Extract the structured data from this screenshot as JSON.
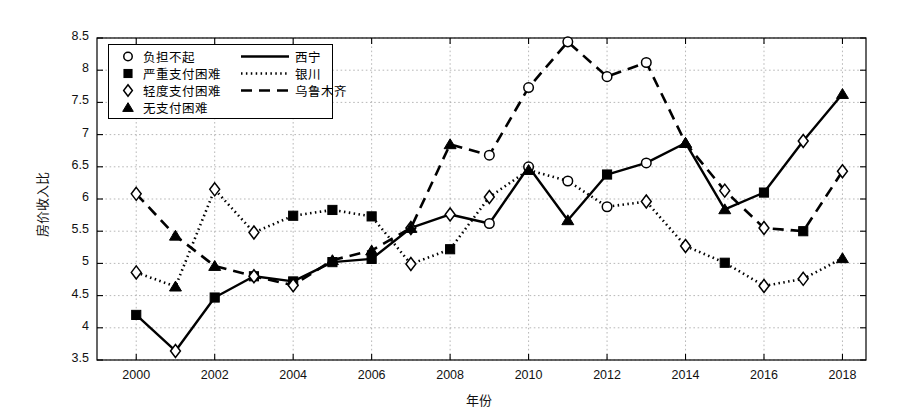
{
  "chart_data": {
    "type": "line",
    "title": "",
    "xlabel": "年份",
    "ylabel": "房价收入比",
    "xlim": [
      1999,
      2018.6
    ],
    "ylim": [
      3.5,
      8.5
    ],
    "grid": true,
    "legend_position": "top-left",
    "x": [
      2000,
      2001,
      2002,
      2003,
      2004,
      2005,
      2006,
      2007,
      2008,
      2009,
      2010,
      2011,
      2012,
      2013,
      2014,
      2015,
      2016,
      2017,
      2018
    ],
    "xticks": [
      2000,
      2002,
      2004,
      2006,
      2008,
      2010,
      2012,
      2014,
      2016,
      2018
    ],
    "xticklabels": [
      "2000",
      "2002",
      "2004",
      "2006",
      "2008",
      "2010",
      "2012",
      "2014",
      "2016",
      "2018"
    ],
    "yticks": [
      3.5,
      4,
      4.5,
      5,
      5.5,
      6,
      6.5,
      7,
      7.5,
      8,
      8.5
    ],
    "yticklabels": [
      "3.5",
      "4",
      "4.5",
      "5",
      "5.5",
      "6",
      "6.5",
      "7",
      "7.5",
      "8",
      "8.5"
    ],
    "series": [
      {
        "name": "西宁",
        "linestyle": "solid",
        "color": "#000000",
        "values": [
          4.2,
          3.64,
          4.47,
          4.8,
          4.72,
          5.02,
          5.07,
          5.55,
          5.76,
          5.62,
          6.5,
          5.67,
          6.38,
          6.56,
          6.87,
          5.84,
          6.1,
          6.9,
          7.63
        ]
      },
      {
        "name": "银川",
        "linestyle": "dotted",
        "color": "#000000",
        "values": [
          4.86,
          4.64,
          6.15,
          5.48,
          5.74,
          5.83,
          5.73,
          4.99,
          5.22,
          6.03,
          6.45,
          6.28,
          5.88,
          5.96,
          5.27,
          5.01,
          4.65,
          4.76,
          5.08
        ]
      },
      {
        "name": "乌鲁木齐",
        "linestyle": "dashed",
        "color": "#000000",
        "values": [
          6.08,
          5.43,
          4.96,
          4.8,
          4.66,
          5.05,
          5.2,
          5.55,
          6.85,
          6.68,
          7.73,
          8.44,
          7.9,
          8.12,
          6.87,
          6.13,
          5.55,
          5.5,
          6.43
        ]
      }
    ],
    "marker_legend": [
      {
        "marker": "circle-open",
        "label": "负担不起"
      },
      {
        "marker": "square-filled",
        "label": "严重支付困难"
      },
      {
        "marker": "diamond-open",
        "label": "轻度支付困难"
      },
      {
        "marker": "triangle-filled",
        "label": "无支付困难"
      }
    ],
    "marker_by_point": {
      "西宁": [
        "square-filled",
        "diamond-open",
        "square-filled",
        "square-filled",
        "square-filled",
        "square-filled",
        "square-filled",
        "diamond-open",
        "diamond-open",
        "circle-open",
        "circle-open",
        "triangle-filled",
        "square-filled",
        "circle-open",
        "triangle-filled",
        "triangle-filled",
        "square-filled",
        "diamond-open",
        "triangle-filled"
      ],
      "银川": [
        "diamond-open",
        "triangle-filled",
        "diamond-open",
        "diamond-open",
        "square-filled",
        "square-filled",
        "square-filled",
        "diamond-open",
        "square-filled",
        "diamond-open",
        "triangle-filled",
        "circle-open",
        "circle-open",
        "diamond-open",
        "diamond-open",
        "square-filled",
        "diamond-open",
        "diamond-open",
        "triangle-filled"
      ],
      "乌鲁木齐": [
        "diamond-open",
        "triangle-filled",
        "triangle-filled",
        "diamond-open",
        "diamond-open",
        "triangle-filled",
        "triangle-filled",
        "triangle-filled",
        "triangle-filled",
        "circle-open",
        "circle-open",
        "circle-open",
        "circle-open",
        "circle-open",
        "triangle-filled",
        "diamond-open",
        "diamond-open",
        "square-filled",
        "diamond-open"
      ]
    }
  }
}
